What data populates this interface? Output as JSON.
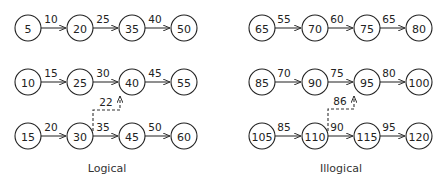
{
  "panels": [
    {
      "caption": "Logical",
      "rows": [
        {
          "nodes": [
            "5",
            "20",
            "35",
            "50"
          ],
          "edges": [
            "10",
            "25",
            "40"
          ]
        },
        {
          "nodes": [
            "10",
            "25",
            "40",
            "55"
          ],
          "edges": [
            "15",
            "30",
            "45"
          ]
        },
        {
          "nodes": [
            "15",
            "30",
            "45",
            "60"
          ],
          "edges": [
            "20",
            "35",
            "50"
          ]
        }
      ],
      "cross_edge": {
        "from": "30",
        "to": "40",
        "label": "22"
      }
    },
    {
      "caption": "Illogical",
      "rows": [
        {
          "nodes": [
            "65",
            "70",
            "75",
            "80"
          ],
          "edges": [
            "55",
            "60",
            "65"
          ]
        },
        {
          "nodes": [
            "85",
            "90",
            "95",
            "100"
          ],
          "edges": [
            "70",
            "75",
            "80"
          ]
        },
        {
          "nodes": [
            "105",
            "110",
            "115",
            "120"
          ],
          "edges": [
            "85",
            "90",
            "95"
          ]
        }
      ],
      "cross_edge": {
        "from": "110",
        "to": "95",
        "label": "86"
      }
    }
  ]
}
